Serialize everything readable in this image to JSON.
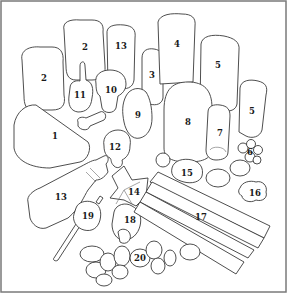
{
  "diagram": {
    "type": "numbered-object-key",
    "border_color": "#7a7a7a",
    "line_color": "#3a3a3a",
    "labels": [
      {
        "id": "1",
        "text": "1",
        "x": 55,
        "y": 136
      },
      {
        "id": "2a",
        "text": "2",
        "x": 44,
        "y": 78
      },
      {
        "id": "2b",
        "text": "2",
        "x": 85,
        "y": 47
      },
      {
        "id": "3",
        "text": "3",
        "x": 152,
        "y": 75
      },
      {
        "id": "4",
        "text": "4",
        "x": 177,
        "y": 44
      },
      {
        "id": "5a",
        "text": "5",
        "x": 218,
        "y": 65
      },
      {
        "id": "5b",
        "text": "5",
        "x": 252,
        "y": 111
      },
      {
        "id": "6",
        "text": "6",
        "x": 250,
        "y": 152
      },
      {
        "id": "7",
        "text": "7",
        "x": 220,
        "y": 133
      },
      {
        "id": "8",
        "text": "8",
        "x": 188,
        "y": 122
      },
      {
        "id": "9",
        "text": "9",
        "x": 138,
        "y": 115
      },
      {
        "id": "10",
        "text": "10",
        "x": 111,
        "y": 90
      },
      {
        "id": "11",
        "text": "11",
        "x": 80,
        "y": 95
      },
      {
        "id": "12",
        "text": "12",
        "x": 115,
        "y": 147
      },
      {
        "id": "13a",
        "text": "13",
        "x": 121,
        "y": 46
      },
      {
        "id": "13b",
        "text": "13",
        "x": 61,
        "y": 197
      },
      {
        "id": "14",
        "text": "14",
        "x": 134,
        "y": 192
      },
      {
        "id": "15",
        "text": "15",
        "x": 187,
        "y": 173
      },
      {
        "id": "16",
        "text": "16",
        "x": 255,
        "y": 193
      },
      {
        "id": "17",
        "text": "17",
        "x": 201,
        "y": 217
      },
      {
        "id": "18",
        "text": "18",
        "x": 130,
        "y": 220
      },
      {
        "id": "19",
        "text": "19",
        "x": 88,
        "y": 216
      },
      {
        "id": "20",
        "text": "20",
        "x": 140,
        "y": 258
      }
    ]
  }
}
